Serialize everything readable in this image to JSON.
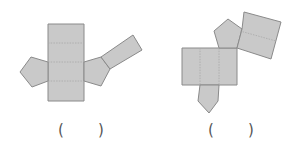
{
  "figures": [
    {
      "id": "left-net",
      "description": "net of a pentagonal prism: vertical strip of 4 rectangles with a pentagon on each side and a tilted square attached to the right pentagon",
      "faces": {
        "rectangles": 5,
        "pentagons": 2
      },
      "answer_blank": {
        "open": "(",
        "close": ")"
      }
    },
    {
      "id": "right-net",
      "description": "net of a pentagonal prism: horizontal strip of 3 rectangles with a pentagon on top and bottom and a tilted pair of rectangles attached to the top pentagon",
      "faces": {
        "rectangles": 5,
        "pentagons": 2
      },
      "answer_blank": {
        "open": "(",
        "close": ")"
      }
    }
  ],
  "colors": {
    "face_fill": "#c9c9c9",
    "face_stroke": "#8a8a8a",
    "fold_line": "#a8a8a8",
    "text": "#555555"
  }
}
